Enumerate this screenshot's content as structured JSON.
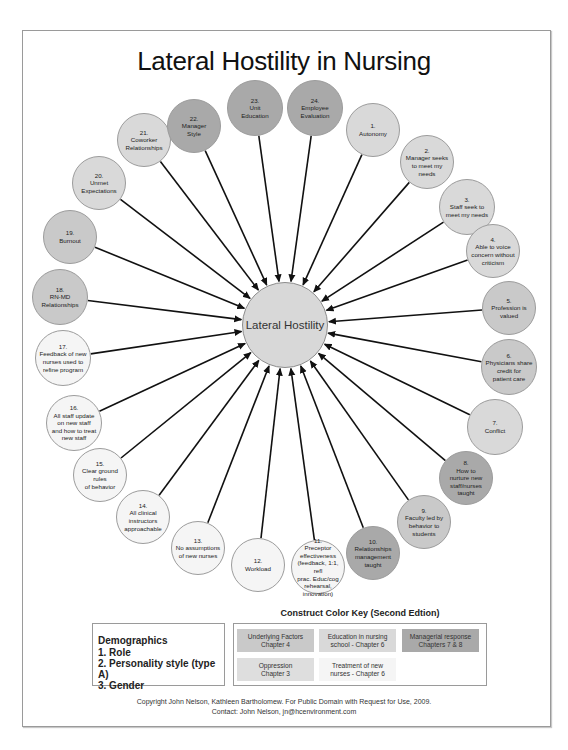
{
  "title": "Lateral Hostility in Nursing",
  "center": {
    "label": "Lateral Hostility",
    "x": 285,
    "y": 325,
    "r": 43,
    "color": "#d8d8d8"
  },
  "colors": {
    "underlying": "#c9c9c9",
    "education": "#d9d9d9",
    "managerial": "#a9a9a9",
    "oppression": "#dedede",
    "treatment": "#f5f5f5"
  },
  "nodes": [
    {
      "num": "1.",
      "label": "Autonomy",
      "x": 373,
      "y": 130,
      "r": 27,
      "type": "education"
    },
    {
      "num": "2.",
      "label": "Manager seeks\nto meet my\nneeds",
      "x": 427,
      "y": 162,
      "r": 27,
      "type": "education"
    },
    {
      "num": "3.",
      "label": "Staff seek to\nmeet my needs",
      "x": 467,
      "y": 207,
      "r": 28,
      "type": "education"
    },
    {
      "num": "4.",
      "label": "Able to voice\nconcern without\ncriticism",
      "x": 493,
      "y": 251,
      "r": 27,
      "type": "education"
    },
    {
      "num": "5.",
      "label": "Profession is\nvalued",
      "x": 509,
      "y": 308,
      "r": 27,
      "type": "underlying"
    },
    {
      "num": "6.",
      "label": "Physicians share\ncredit for\npatient care",
      "x": 509,
      "y": 367,
      "r": 28,
      "type": "underlying"
    },
    {
      "num": "7.",
      "label": "Conflict",
      "x": 495,
      "y": 427,
      "r": 28,
      "type": "education"
    },
    {
      "num": "8.",
      "label": "How to\nnurture new\nstaff/nurses\ntaught",
      "x": 466,
      "y": 478,
      "r": 27,
      "type": "managerial"
    },
    {
      "num": "9.",
      "label": "Faculty led by\nbehavior to\nstudents",
      "x": 424,
      "y": 522,
      "r": 27,
      "type": "underlying"
    },
    {
      "num": "10.",
      "label": "Relationships\nmanagement\ntaught",
      "x": 373,
      "y": 553,
      "r": 27,
      "type": "managerial"
    },
    {
      "num": "11.",
      "label": "Preceptor\neffectiveness\n(feedback, 1:1, refl\nprac. Educ/cog\nrehearsal,\ninnovation)",
      "x": 318,
      "y": 567,
      "r": 27,
      "type": "treatment"
    },
    {
      "num": "12.",
      "label": "Workload",
      "x": 258,
      "y": 565,
      "r": 27,
      "type": "treatment"
    },
    {
      "num": "13.",
      "label": "No assumptions\nof new nurses",
      "x": 198,
      "y": 548,
      "r": 27,
      "type": "treatment"
    },
    {
      "num": "14.",
      "label": "All clinical\ninstructors\napproachable",
      "x": 143,
      "y": 517,
      "r": 27,
      "type": "treatment"
    },
    {
      "num": "15.",
      "label": "Clear ground rules\nof behavior",
      "x": 100,
      "y": 475,
      "r": 27,
      "type": "treatment"
    },
    {
      "num": "16.",
      "label": "All staff update\non new staff\nand how to treat\nnew staff",
      "x": 74,
      "y": 423,
      "r": 28,
      "type": "treatment"
    },
    {
      "num": "17.",
      "label": "Feedback of new\nnurses used to\nrefine program",
      "x": 63,
      "y": 358,
      "r": 28,
      "type": "treatment"
    },
    {
      "num": "18.",
      "label": "RN-MD\nRelationships",
      "x": 60,
      "y": 297,
      "r": 28,
      "type": "underlying"
    },
    {
      "num": "19.",
      "label": "Burnout",
      "x": 70,
      "y": 237,
      "r": 27,
      "type": "underlying"
    },
    {
      "num": "20.",
      "label": "Unmet\nExpectations",
      "x": 99,
      "y": 183,
      "r": 27,
      "type": "education"
    },
    {
      "num": "21.",
      "label": "Coworker\nRelationships",
      "x": 144,
      "y": 140,
      "r": 27,
      "type": "education"
    },
    {
      "num": "22.",
      "label": "Manager\nStyle",
      "x": 194,
      "y": 126,
      "r": 27,
      "type": "managerial"
    },
    {
      "num": "23.",
      "label": "Unit\nEducation",
      "x": 255,
      "y": 108,
      "r": 28,
      "type": "managerial"
    },
    {
      "num": "24.",
      "label": "Employee\nEvaluation",
      "x": 315,
      "y": 108,
      "r": 28,
      "type": "managerial"
    }
  ],
  "demographics": {
    "heading": "Demographics",
    "items": [
      "1.  Role",
      "2.  Personality style (type A)",
      "3.  Gender"
    ]
  },
  "color_key": {
    "title": "Construct Color Key (Second Edtion)",
    "items": [
      {
        "label": "Underlying Factors\nChapter 4",
        "type": "underlying"
      },
      {
        "label": "Education in nursing\nschool - Chapter 6",
        "type": "education"
      },
      {
        "label": "Managerial response\nChapters 7 & 8",
        "type": "managerial"
      },
      {
        "label": "Oppression\nChapter 3",
        "type": "oppression"
      },
      {
        "label": "Treatment of new\nnurses - Chapter 6",
        "type": "treatment"
      }
    ]
  },
  "copyright": {
    "line1": "Copyright John Nelson, Kathleen Bartholomew.  For Public Domain with Request for Use, 2009.",
    "line2": "Contact: John Nelson, jn@hcenvironment.com"
  }
}
